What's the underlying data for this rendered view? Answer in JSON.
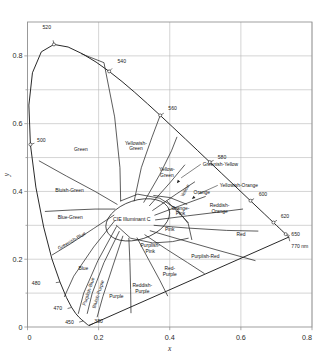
{
  "chart_data": {
    "type": "line",
    "title": "",
    "subtitle": "",
    "xlabel": "x",
    "ylabel": "y",
    "xlim": [
      0,
      0.8
    ],
    "ylim": [
      0,
      0.9
    ],
    "grid": true,
    "legend_position": "none",
    "xticks": [
      "0",
      "0.2",
      "0.4",
      "0.6",
      "0.8"
    ],
    "xtick_values": [
      0,
      0.2,
      0.4,
      0.6,
      0.8
    ],
    "yticks": [
      "0",
      "0.2",
      "0.4",
      "0.6",
      "0.8"
    ],
    "ytick_values": [
      0,
      0.2,
      0.4,
      0.6,
      0.8
    ],
    "white_point": {
      "label": "CIE  Illuminant C",
      "x": 0.3101,
      "y": 0.3162
    },
    "spectral_locus": [
      [
        0.1741,
        0.005
      ],
      [
        0.174,
        0.005
      ],
      [
        0.1738,
        0.0049
      ],
      [
        0.1736,
        0.0049
      ],
      [
        0.1733,
        0.0048
      ],
      [
        0.173,
        0.0048
      ],
      [
        0.1726,
        0.0048
      ],
      [
        0.1721,
        0.0048
      ],
      [
        0.1714,
        0.0051
      ],
      [
        0.1703,
        0.0058
      ],
      [
        0.1689,
        0.0069
      ],
      [
        0.1669,
        0.0086
      ],
      [
        0.1644,
        0.0109
      ],
      [
        0.1611,
        0.0138
      ],
      [
        0.1566,
        0.0177
      ],
      [
        0.151,
        0.0227
      ],
      [
        0.144,
        0.0297
      ],
      [
        0.1355,
        0.0399
      ],
      [
        0.1241,
        0.0578
      ],
      [
        0.1096,
        0.0868
      ],
      [
        0.0913,
        0.1327
      ],
      [
        0.0687,
        0.2007
      ],
      [
        0.0454,
        0.295
      ],
      [
        0.0235,
        0.4127
      ],
      [
        0.0082,
        0.5384
      ],
      [
        0.0039,
        0.6548
      ],
      [
        0.0139,
        0.7502
      ],
      [
        0.0389,
        0.812
      ],
      [
        0.0743,
        0.8338
      ],
      [
        0.1142,
        0.8262
      ],
      [
        0.1547,
        0.8059
      ],
      [
        0.1929,
        0.7816
      ],
      [
        0.2296,
        0.7543
      ],
      [
        0.2658,
        0.7243
      ],
      [
        0.3016,
        0.6923
      ],
      [
        0.3373,
        0.6589
      ],
      [
        0.3731,
        0.6245
      ],
      [
        0.4087,
        0.5896
      ],
      [
        0.4441,
        0.5547
      ],
      [
        0.4788,
        0.5202
      ],
      [
        0.5125,
        0.4866
      ],
      [
        0.5448,
        0.4544
      ],
      [
        0.5752,
        0.4242
      ],
      [
        0.6029,
        0.3965
      ],
      [
        0.627,
        0.3725
      ],
      [
        0.6482,
        0.3514
      ],
      [
        0.6658,
        0.334
      ],
      [
        0.6801,
        0.3197
      ],
      [
        0.6915,
        0.3083
      ],
      [
        0.7006,
        0.2993
      ],
      [
        0.7079,
        0.292
      ],
      [
        0.714,
        0.2859
      ],
      [
        0.719,
        0.2809
      ],
      [
        0.723,
        0.277
      ],
      [
        0.726,
        0.274
      ],
      [
        0.7283,
        0.2717
      ],
      [
        0.73,
        0.27
      ],
      [
        0.7311,
        0.2689
      ],
      [
        0.732,
        0.268
      ],
      [
        0.7327,
        0.2673
      ],
      [
        0.7334,
        0.2666
      ],
      [
        0.734,
        0.266
      ],
      [
        0.7344,
        0.2656
      ],
      [
        0.7346,
        0.2654
      ],
      [
        0.7347,
        0.2653
      ]
    ],
    "wavelength_marks": [
      {
        "label": "380",
        "x": 0.1741,
        "y": 0.005,
        "lx": 0.188,
        "ly": 0.012,
        "dot": false
      },
      {
        "label": "450",
        "x": 0.1566,
        "y": 0.0177,
        "lx": 0.13,
        "ly": 0.01,
        "dot": false
      },
      {
        "label": "470",
        "x": 0.1241,
        "y": 0.0578,
        "lx": 0.097,
        "ly": 0.05,
        "dot": false
      },
      {
        "label": "480",
        "x": 0.0913,
        "y": 0.1327,
        "lx": 0.036,
        "ly": 0.124,
        "dot": false
      },
      {
        "label": "500",
        "x": 0.0082,
        "y": 0.5384,
        "lx": 0.027,
        "ly": 0.545,
        "dot": true
      },
      {
        "label": "520",
        "x": 0.0743,
        "y": 0.8338,
        "lx": 0.066,
        "ly": 0.878,
        "dot": true
      },
      {
        "label": "540",
        "x": 0.2296,
        "y": 0.7543,
        "lx": 0.253,
        "ly": 0.779,
        "dot": true
      },
      {
        "label": "560",
        "x": 0.3731,
        "y": 0.6245,
        "lx": 0.396,
        "ly": 0.639,
        "dot": true
      },
      {
        "label": "580",
        "x": 0.5125,
        "y": 0.4866,
        "lx": 0.535,
        "ly": 0.497,
        "dot": true
      },
      {
        "label": "600",
        "x": 0.627,
        "y": 0.3725,
        "lx": 0.65,
        "ly": 0.387,
        "dot": true
      },
      {
        "label": "620",
        "x": 0.6915,
        "y": 0.3083,
        "lx": 0.712,
        "ly": 0.322,
        "dot": true
      },
      {
        "label": "650",
        "x": 0.726,
        "y": 0.274,
        "lx": 0.742,
        "ly": 0.268,
        "dot": true
      },
      {
        "label": "770 nm",
        "x": 0.7347,
        "y": 0.2653,
        "lx": 0.742,
        "ly": 0.232,
        "dot": false
      }
    ],
    "regions": [
      {
        "name": "Green",
        "label": "Green",
        "x": 0.15,
        "y": 0.52,
        "rotate": 0,
        "lines": [
          "Green"
        ]
      },
      {
        "name": "Yellowish-Green",
        "label": "Yellowish-Green",
        "x": 0.305,
        "y": 0.53,
        "rotate": 0,
        "lines": [
          "Yellowish-",
          "Green"
        ]
      },
      {
        "name": "Yellow-Green",
        "label": "Yellow-Green",
        "x": 0.392,
        "y": 0.452,
        "rotate": 0,
        "lines": [
          "Yellow-",
          "Green"
        ]
      },
      {
        "name": "Greenish-Yellow",
        "label": "Greenish-Yellow",
        "x": 0.43,
        "y": 0.432,
        "rotate": -40,
        "lines": []
      },
      {
        "name": "Yellow",
        "label": "Yellow",
        "x": 0.447,
        "y": 0.4,
        "rotate": -62,
        "lines": [
          "Yellow"
        ]
      },
      {
        "name": "Yellowish-Orange",
        "label": "Yellowish-Orange",
        "x": 0.47,
        "y": 0.36,
        "rotate": -40,
        "lines": []
      },
      {
        "name": "Orange",
        "label": "Orange",
        "x": 0.49,
        "y": 0.392,
        "rotate": 0,
        "lines": [
          "Orange"
        ]
      },
      {
        "name": "Reddish-Orange",
        "label": "Reddish-Orange",
        "x": 0.54,
        "y": 0.345,
        "rotate": 0,
        "lines": [
          "Reddish-",
          "Orange"
        ]
      },
      {
        "name": "Red",
        "label": "Red",
        "x": 0.6,
        "y": 0.268,
        "rotate": 0,
        "lines": [
          "Red"
        ]
      },
      {
        "name": "Orange-Pink",
        "label": "Orange-Pink",
        "x": 0.43,
        "y": 0.338,
        "rotate": 0,
        "lines": [
          "Orange-",
          "Pink"
        ]
      },
      {
        "name": "Pink",
        "label": "Pink",
        "x": 0.4,
        "y": 0.282,
        "rotate": 0,
        "lines": [
          "Pink"
        ]
      },
      {
        "name": "Purplish-Red",
        "label": "Purplish-Red",
        "x": 0.5,
        "y": 0.205,
        "rotate": 0,
        "lines": [
          "Purplish-Red"
        ]
      },
      {
        "name": "Purplish-Pink",
        "label": "Purplish-Pink",
        "x": 0.345,
        "y": 0.228,
        "rotate": 0,
        "lines": [
          "Purplish-",
          "Pink"
        ]
      },
      {
        "name": "Red-Purple",
        "label": "Red-Purple",
        "x": 0.4,
        "y": 0.16,
        "rotate": 0,
        "lines": [
          "Red-",
          "Purple"
        ]
      },
      {
        "name": "Reddish-Purple",
        "label": "Reddish-Purple",
        "x": 0.323,
        "y": 0.11,
        "rotate": 0,
        "lines": [
          "Reddish-",
          "Purple"
        ]
      },
      {
        "name": "Purple",
        "label": "Purple",
        "x": 0.25,
        "y": 0.085,
        "rotate": 0,
        "lines": [
          "Purple"
        ]
      },
      {
        "name": "Bluish-Purple",
        "label": "Bluish-Purple",
        "x": 0.203,
        "y": 0.095,
        "rotate": -72,
        "lines": [
          "Bluish-Purple"
        ]
      },
      {
        "name": "Purplish-Blue",
        "label": "Purplish-Blue",
        "x": 0.176,
        "y": 0.103,
        "rotate": -72,
        "lines": [
          "Purplish-Blue"
        ]
      },
      {
        "name": "Blue",
        "label": "Blue",
        "x": 0.157,
        "y": 0.168,
        "rotate": 0,
        "lines": [
          "Blue"
        ]
      },
      {
        "name": "Greenish-Blue",
        "label": "Greenish-Blue",
        "x": 0.127,
        "y": 0.25,
        "rotate": -30,
        "lines": [
          "Greenish-Blue"
        ]
      },
      {
        "name": "Blue-Green",
        "label": "Blue-Green",
        "x": 0.12,
        "y": 0.318,
        "rotate": 0,
        "lines": [
          "Blue-Green"
        ]
      },
      {
        "name": "Bluish-Green",
        "label": "Bluish-Green",
        "x": 0.118,
        "y": 0.398,
        "rotate": 0,
        "lines": [
          "Bluish-Green"
        ]
      }
    ],
    "colors": {
      "line": "#1d1d1d",
      "grid": "#b9b9b9",
      "frame": "#8f8f8f",
      "text": "#111111",
      "background": "#ffffff"
    }
  }
}
